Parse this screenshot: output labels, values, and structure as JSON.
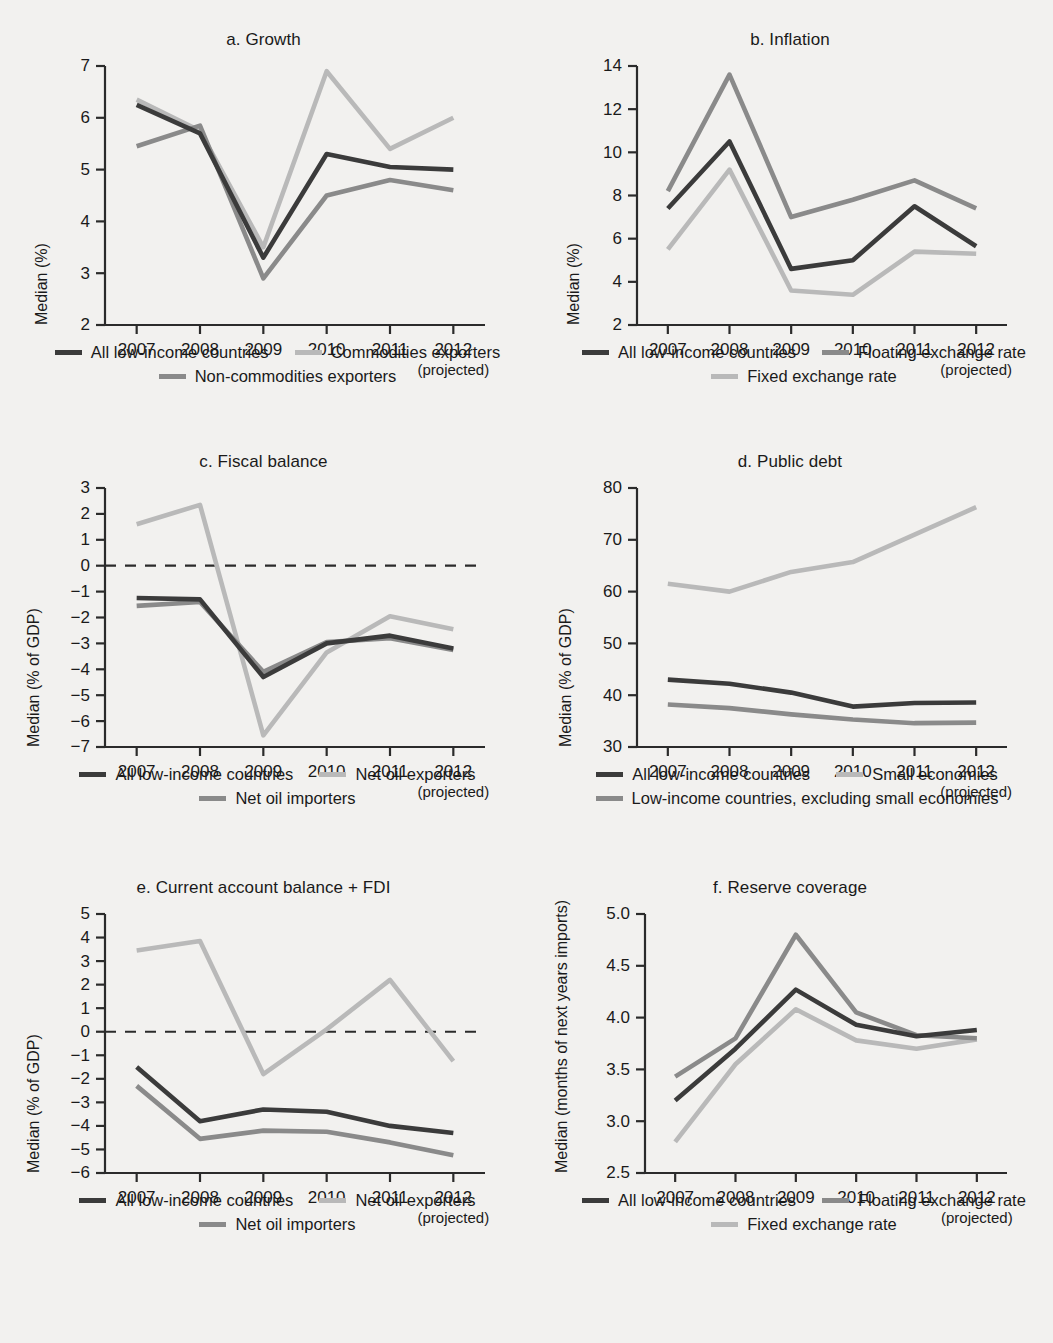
{
  "colors": {
    "dark": "#3b3b3b",
    "light": "#b9b9b9",
    "mid": "#8a8a8a",
    "axis": "#2b2b2b",
    "background": "#f2f1ef"
  },
  "x_categories": [
    "2007",
    "2008",
    "2009",
    "2010",
    "2011",
    "2012"
  ],
  "x_sub_label": "(projected)",
  "chart_data": [
    {
      "id": "a",
      "type": "line",
      "title": "a.  Growth",
      "xlabel": "",
      "ylabel": "Median (%)",
      "ylim": [
        2,
        7
      ],
      "yticks": [
        2,
        3,
        4,
        5,
        6,
        7
      ],
      "ytick_labels": [
        "2",
        "3",
        "4",
        "5",
        "6",
        "7"
      ],
      "grid": false,
      "zero_line": false,
      "categories": [
        "2007",
        "2008",
        "2009",
        "2010",
        "2011",
        "2012"
      ],
      "series": [
        {
          "name": "All low-income countries",
          "color": "dark",
          "values": [
            6.25,
            5.7,
            3.3,
            5.3,
            5.05,
            5.0
          ]
        },
        {
          "name": "Commodities exporters",
          "color": "light",
          "values": [
            6.35,
            5.75,
            3.5,
            6.9,
            5.4,
            6.0
          ]
        },
        {
          "name": "Non-commodities exporters",
          "color": "mid",
          "values": [
            5.45,
            5.85,
            2.9,
            4.5,
            4.8,
            4.6
          ]
        }
      ],
      "legend": {
        "position": "below",
        "rows": [
          [
            "All low-income countries",
            "Commodities exporters"
          ],
          [
            "Non-commodities exporters"
          ]
        ]
      }
    },
    {
      "id": "b",
      "type": "line",
      "title": "b.  Inflation",
      "xlabel": "",
      "ylabel": "Median (%)",
      "ylim": [
        2,
        14
      ],
      "yticks": [
        2,
        4,
        6,
        8,
        10,
        12,
        14
      ],
      "ytick_labels": [
        "2",
        "4",
        "6",
        "8",
        "10",
        "12",
        "14"
      ],
      "grid": false,
      "zero_line": false,
      "categories": [
        "2007",
        "2008",
        "2009",
        "2010",
        "2011",
        "2012"
      ],
      "series": [
        {
          "name": "All low-income countries",
          "color": "dark",
          "values": [
            7.4,
            10.5,
            4.6,
            5.0,
            7.5,
            5.65
          ]
        },
        {
          "name": "Floating exchange rate",
          "color": "mid",
          "values": [
            8.2,
            13.6,
            7.0,
            7.8,
            8.7,
            7.4
          ]
        },
        {
          "name": "Fixed exchange rate",
          "color": "light",
          "values": [
            5.5,
            9.2,
            3.6,
            3.4,
            5.4,
            5.3
          ]
        }
      ],
      "legend": {
        "position": "below",
        "rows": [
          [
            "All low-income countries",
            "Floating exchange rate"
          ],
          [
            "Fixed exchange rate"
          ]
        ]
      }
    },
    {
      "id": "c",
      "type": "line",
      "title": "c.  Fiscal balance",
      "xlabel": "",
      "ylabel": "Median (% of GDP)",
      "ylim": [
        -7,
        3
      ],
      "yticks": [
        -7,
        -6,
        -5,
        -4,
        -3,
        -2,
        -1,
        0,
        1,
        2,
        3
      ],
      "ytick_labels": [
        "−7",
        "−6",
        "−5",
        "−4",
        "−3",
        "−2",
        "−1",
        "0",
        "1",
        "2",
        "3"
      ],
      "grid": false,
      "zero_line": true,
      "categories": [
        "2007",
        "2008",
        "2009",
        "2010",
        "2011",
        "2012"
      ],
      "series": [
        {
          "name": "All low-income countries",
          "color": "dark",
          "values": [
            -1.25,
            -1.3,
            -4.3,
            -3.0,
            -2.7,
            -3.2
          ]
        },
        {
          "name": "Net oil exporters",
          "color": "light",
          "values": [
            1.6,
            2.35,
            -6.55,
            -3.35,
            -1.95,
            -2.45
          ]
        },
        {
          "name": "Net oil importers",
          "color": "mid",
          "values": [
            -1.55,
            -1.4,
            -4.1,
            -2.95,
            -2.8,
            -3.25
          ]
        }
      ],
      "legend": {
        "position": "below",
        "rows": [
          [
            "All low-income countries",
            "Net oil exporters"
          ],
          [
            "Net oil importers"
          ]
        ]
      }
    },
    {
      "id": "d",
      "type": "line",
      "title": "d.  Public debt",
      "xlabel": "",
      "ylabel": "Median (% of GDP)",
      "ylim": [
        30,
        80
      ],
      "yticks": [
        30,
        40,
        50,
        60,
        70,
        80
      ],
      "ytick_labels": [
        "30",
        "40",
        "50",
        "60",
        "70",
        "80"
      ],
      "grid": false,
      "zero_line": false,
      "categories": [
        "2007",
        "2008",
        "2009",
        "2010",
        "2011",
        "2012"
      ],
      "series": [
        {
          "name": "All low-income countries",
          "color": "dark",
          "values": [
            43.0,
            42.2,
            40.5,
            37.8,
            38.5,
            38.6
          ]
        },
        {
          "name": "Small economies",
          "color": "light",
          "values": [
            61.5,
            60.0,
            63.8,
            65.7,
            71.0,
            76.3
          ]
        },
        {
          "name": "Low-income countries, excluding small economies",
          "color": "mid",
          "values": [
            38.2,
            37.5,
            36.3,
            35.3,
            34.6,
            34.7
          ]
        }
      ],
      "legend": {
        "position": "below",
        "rows": [
          [
            "All low-income countries",
            "Small economies"
          ],
          [
            "Low-income countries, excluding small economies"
          ]
        ]
      }
    },
    {
      "id": "e",
      "type": "line",
      "title": "e.  Current account balance + FDI",
      "xlabel": "",
      "ylabel": "Median (% of GDP)",
      "ylim": [
        -6,
        5
      ],
      "yticks": [
        -6,
        -5,
        -4,
        -3,
        -2,
        -1,
        0,
        1,
        2,
        3,
        4,
        5
      ],
      "ytick_labels": [
        "−6",
        "−5",
        "−4",
        "−3",
        "−2",
        "−1",
        "0",
        "1",
        "2",
        "3",
        "4",
        "5"
      ],
      "grid": false,
      "zero_line": true,
      "categories": [
        "2007",
        "2008",
        "2009",
        "2010",
        "2011",
        "2012"
      ],
      "series": [
        {
          "name": "All low-income countries",
          "color": "dark",
          "values": [
            -1.5,
            -3.8,
            -3.3,
            -3.4,
            -4.0,
            -4.3
          ]
        },
        {
          "name": "Net oil exporters",
          "color": "light",
          "values": [
            3.45,
            3.85,
            -1.8,
            0.1,
            2.2,
            -1.25
          ]
        },
        {
          "name": "Net oil importers",
          "color": "mid",
          "values": [
            -2.3,
            -4.55,
            -4.2,
            -4.25,
            -4.7,
            -5.25
          ]
        }
      ],
      "legend": {
        "position": "below",
        "rows": [
          [
            "All low-income countries",
            "Net oil exporters"
          ],
          [
            "Net oil importers"
          ]
        ]
      }
    },
    {
      "id": "f",
      "type": "line",
      "title": "f.  Reserve coverage",
      "xlabel": "",
      "ylabel": "Median (months of next years imports)",
      "ylim": [
        2.5,
        5.0
      ],
      "yticks": [
        2.5,
        3.0,
        3.5,
        4.0,
        4.5,
        5.0
      ],
      "ytick_labels": [
        "2.5",
        "3.0",
        "3.5",
        "4.0",
        "4.5",
        "5.0"
      ],
      "grid": false,
      "zero_line": false,
      "categories": [
        "2007",
        "2008",
        "2009",
        "2010",
        "2011",
        "2012"
      ],
      "series": [
        {
          "name": "All low-income countries",
          "color": "dark",
          "values": [
            3.2,
            3.7,
            4.27,
            3.93,
            3.82,
            3.88
          ]
        },
        {
          "name": "Floating exchange rate",
          "color": "mid",
          "values": [
            3.43,
            3.8,
            4.8,
            4.05,
            3.83,
            3.8
          ]
        },
        {
          "name": "Fixed exchange rate",
          "color": "light",
          "values": [
            2.8,
            3.55,
            4.08,
            3.78,
            3.7,
            3.79
          ]
        }
      ],
      "legend": {
        "position": "below",
        "rows": [
          [
            "All low-income countries",
            "Floating exchange rate"
          ],
          [
            "Fixed exchange rate"
          ]
        ]
      }
    }
  ]
}
